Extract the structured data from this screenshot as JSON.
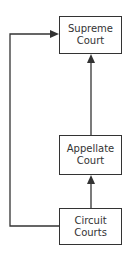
{
  "diagram": {
    "type": "flowchart",
    "nodes": [
      {
        "id": "supreme",
        "line1": "Supreme",
        "line2": "Court"
      },
      {
        "id": "appellate",
        "line1": "Appellate",
        "line2": "Court"
      },
      {
        "id": "circuit",
        "line1": "Circuit",
        "line2": "Courts"
      }
    ],
    "edges": [
      {
        "from": "circuit",
        "to": "appellate"
      },
      {
        "from": "appellate",
        "to": "supreme"
      },
      {
        "from": "circuit",
        "to": "supreme",
        "route": "left-loop"
      }
    ],
    "colors": {
      "stroke": "#333333",
      "background": "#ffffff"
    }
  }
}
